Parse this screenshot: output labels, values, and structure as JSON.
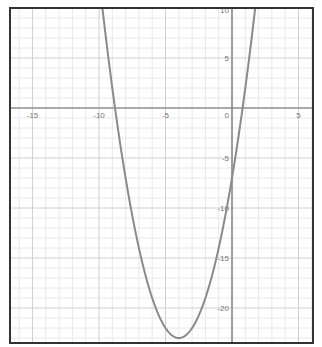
{
  "chart_data": {
    "type": "line",
    "title": "",
    "xlabel": "",
    "ylabel": "",
    "function": "y = x^2 + 8x - 7",
    "coefficients": {
      "a": 1,
      "b": 8,
      "c": -7
    },
    "vertex": [
      -4,
      -23
    ],
    "roots": [
      -8.8,
      0.8
    ],
    "y_intercept": -7,
    "xlim": [
      -16.7,
      6.1
    ],
    "ylim": [
      -23.5,
      10
    ],
    "grid": true,
    "minor_grid_step": 1,
    "major_grid_step": 5,
    "x_ticks": [
      -15,
      -10,
      -5,
      0,
      5
    ],
    "y_ticks": [
      10,
      5,
      -5,
      -10,
      -15,
      -20
    ],
    "x_tick_labels": [
      "-15",
      "-10",
      "-5",
      "0",
      "5"
    ],
    "y_tick_labels": [
      "10",
      "5",
      "-5",
      "-10",
      "-15",
      "-20"
    ],
    "origin_label": "0",
    "legend": null,
    "colors": {
      "curve": "#8a8a8a",
      "axis": "#6e6e6e",
      "frame": "#333333",
      "major_grid": "#d0d0d0",
      "minor_grid": "#e8e8e8",
      "label": "#777777"
    }
  },
  "layout": {
    "frame": {
      "left": 10,
      "top": 8,
      "right": 313,
      "bottom": 343
    },
    "origin_px": [
      232,
      108
    ],
    "px_per_x_unit": 13.3,
    "px_per_y_unit": 10
  }
}
